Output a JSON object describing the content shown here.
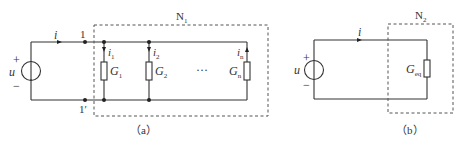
{
  "figure_a": {
    "caption": "（a）",
    "source_label": "u",
    "plus": "+",
    "minus": "−",
    "current_label": "i",
    "node_top": "1",
    "node_bottom": "1′",
    "network_label": "N",
    "network_sub": "1",
    "branches": [
      {
        "current": "i",
        "current_sub": "1",
        "conductance": "G",
        "conductance_sub": "1"
      },
      {
        "current": "i",
        "current_sub": "2",
        "conductance": "G",
        "conductance_sub": "2"
      },
      {
        "current": "i",
        "current_sub": "n",
        "conductance": "G",
        "conductance_sub": "n"
      }
    ],
    "ellipsis": "···"
  },
  "figure_b": {
    "caption": "（b）",
    "source_label": "u",
    "plus": "+",
    "minus": "−",
    "current_label": "i",
    "network_label": "N",
    "network_sub": "2",
    "conductance": "G",
    "conductance_sub": "eq"
  },
  "colors": {
    "line": "#333333",
    "background": "#ffffff"
  }
}
